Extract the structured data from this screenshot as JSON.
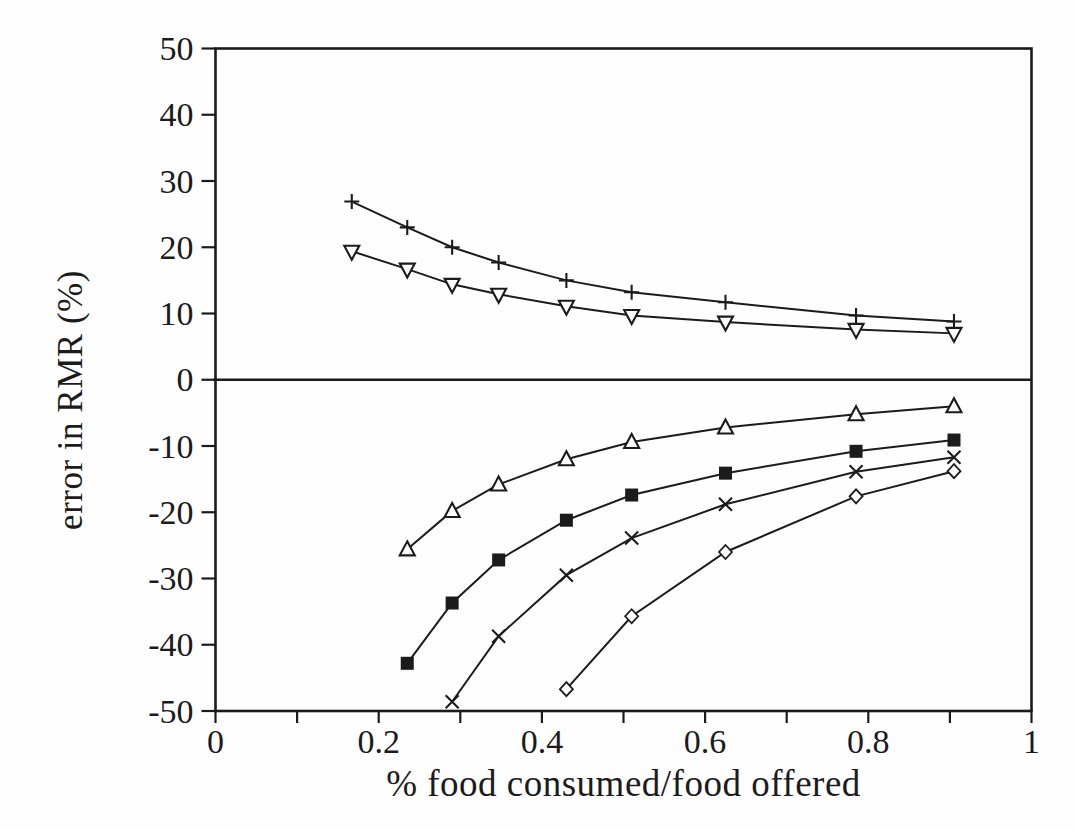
{
  "figure": {
    "background": "#fefefe",
    "ink_color": "#1b1b1b"
  },
  "chart_data": {
    "type": "line",
    "title": "",
    "xlabel": "% food consumed/food offered",
    "ylabel": "error in RMR (%)",
    "xlim": [
      0,
      1
    ],
    "ylim": [
      -50,
      50
    ],
    "grid": false,
    "legend": "none",
    "zero_line": true,
    "frame": true,
    "x_major_ticks": [
      0,
      0.2,
      0.4,
      0.6,
      0.8,
      1
    ],
    "x_major_tick_labels": [
      "0",
      "0.2",
      "0.4",
      "0.6",
      "0.8",
      "1"
    ],
    "x_minor_ticks": [
      0.1,
      0.3,
      0.5,
      0.7,
      0.9
    ],
    "y_ticks": [
      50,
      40,
      30,
      20,
      10,
      0,
      -10,
      -20,
      -30,
      -40,
      -50
    ],
    "y_tick_labels": [
      "50",
      "40",
      "30",
      "20",
      "10",
      "0",
      "-10",
      "-20",
      "-30",
      "-40",
      "-50"
    ],
    "series": [
      {
        "name": "plus-series",
        "marker": "plus",
        "x": [
          0.167,
          0.235,
          0.29,
          0.347,
          0.43,
          0.51,
          0.625,
          0.785,
          0.905
        ],
        "y": [
          26.9,
          23.0,
          20.0,
          17.7,
          15.0,
          13.2,
          11.7,
          9.7,
          8.8
        ]
      },
      {
        "name": "triangle-down-series",
        "marker": "triangle-down",
        "x": [
          0.167,
          0.235,
          0.29,
          0.347,
          0.43,
          0.51,
          0.625,
          0.785,
          0.905
        ],
        "y": [
          19.4,
          16.7,
          14.4,
          12.9,
          11.1,
          9.7,
          8.7,
          7.6,
          7.0
        ]
      },
      {
        "name": "triangle-up-series",
        "marker": "triangle-up",
        "x": [
          0.235,
          0.29,
          0.347,
          0.43,
          0.51,
          0.625,
          0.785,
          0.905
        ],
        "y": [
          -25.6,
          -19.8,
          -15.8,
          -12.0,
          -9.4,
          -7.2,
          -5.2,
          -4.0
        ]
      },
      {
        "name": "filled-square-series",
        "marker": "square-filled",
        "x": [
          0.235,
          0.29,
          0.347,
          0.43,
          0.51,
          0.625,
          0.785,
          0.905
        ],
        "y": [
          -42.8,
          -33.7,
          -27.2,
          -21.2,
          -17.4,
          -14.1,
          -10.8,
          -9.1
        ]
      },
      {
        "name": "x-cross-series",
        "marker": "x-cross",
        "x": [
          0.29,
          0.347,
          0.43,
          0.51,
          0.625,
          0.785,
          0.905
        ],
        "y": [
          -48.6,
          -38.7,
          -29.5,
          -23.9,
          -18.8,
          -13.9,
          -11.7
        ]
      },
      {
        "name": "diamond-series",
        "marker": "diamond-open",
        "x": [
          0.43,
          0.51,
          0.625,
          0.785,
          0.905
        ],
        "y": [
          -46.7,
          -35.7,
          -26.0,
          -17.6,
          -13.8
        ]
      }
    ]
  }
}
